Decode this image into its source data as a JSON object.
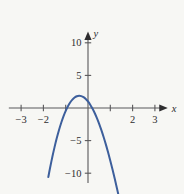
{
  "chart_data": {
    "type": "line",
    "title": "",
    "xlabel": "x",
    "ylabel": "y",
    "xlim": [
      -3.55,
      3.6
    ],
    "ylim": [
      -11.5,
      11.8
    ],
    "grid": false,
    "legend": null,
    "axis_style": "centered-cross-with-arrows",
    "xticks": [
      -3,
      -2,
      -1,
      1,
      2,
      3
    ],
    "xtick_labels": [
      "−3",
      "−2",
      "",
      "",
      "2",
      "3"
    ],
    "yticks": [
      -10,
      -5,
      5,
      10
    ],
    "ytick_labels": [
      "−10",
      "−5",
      "5",
      "10"
    ],
    "series": [
      {
        "name": "cubic",
        "color": "#3d5f9c",
        "x": [
          -1.78,
          -1.7,
          -1.6,
          -1.5,
          -1.4,
          -1.3,
          -1.2,
          -1.1,
          -1.0,
          -0.9,
          -0.8,
          -0.7,
          -0.6,
          -0.5,
          -0.4,
          -0.3,
          -0.2,
          -0.1,
          0.0,
          0.1,
          0.2,
          0.3,
          0.4,
          0.5,
          0.6,
          0.7,
          0.8,
          0.9,
          1.0,
          1.1,
          1.2,
          1.3,
          1.4,
          1.5,
          1.6,
          1.7,
          1.8,
          1.9,
          2.0,
          2.1,
          2.2,
          2.3,
          2.4,
          2.5,
          2.6,
          2.7,
          2.78
        ],
        "y": [
          -10.6,
          -9.17,
          -7.52,
          -6.0,
          -4.62,
          -3.37,
          -2.26,
          -1.28,
          -0.44,
          0.27,
          0.85,
          1.29,
          1.61,
          1.8,
          1.87,
          1.82,
          1.66,
          1.38,
          1.0,
          0.51,
          -0.08,
          -0.77,
          -1.55,
          -2.42,
          -3.39,
          -4.44,
          -5.58,
          -6.79,
          -8.08,
          -9.44,
          -10.86,
          -12.34,
          -13.87,
          -15.44,
          -17.04,
          -18.67,
          -20.31,
          -21.95,
          -23.58,
          -25.18,
          -26.74,
          -28.24,
          -29.65,
          -30.96,
          -32.14,
          -33.17,
          -33.9
        ]
      }
    ],
    "curve_features": {
      "local_max": {
        "x": -0.6,
        "y": 1.9
      },
      "local_min": {
        "x": 1.1,
        "y": -2.2
      },
      "x_intercepts": [
        -1.0,
        0.28,
        1.85
      ],
      "y_intercept": 1.0,
      "left_endpoint": {
        "x": -1.78,
        "y": -10.6
      },
      "right_endpoint": {
        "x": 2.78,
        "y": 11.2
      }
    }
  },
  "colors": {
    "background": "#f7f7f4",
    "axis": "#59585a",
    "text": "#2e2d2f",
    "curve": "#3d5f9c"
  }
}
